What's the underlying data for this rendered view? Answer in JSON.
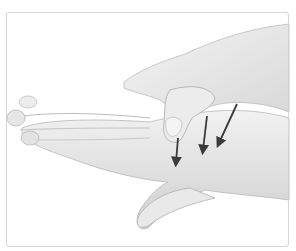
{
  "figure": {
    "colors": {
      "background": "#ffffff",
      "frame_border": "#d6d6d6",
      "skin_light": "#efefef",
      "skin_mid": "#d9d9d9",
      "skin_shadow": "#a8a8a8",
      "arrow": "#3a3a3a"
    },
    "arrows": [
      {
        "label": "arrow-1",
        "direction": "down"
      },
      {
        "label": "arrow-2",
        "direction": "down"
      },
      {
        "label": "arrow-3",
        "direction": "down-left"
      }
    ]
  }
}
